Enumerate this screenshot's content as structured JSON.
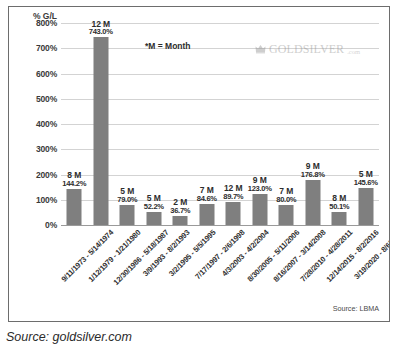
{
  "figure": {
    "source_caption": "Source: goldsilver.com",
    "inner_source": "Source: LBMA",
    "note": "*M = Month",
    "watermark": {
      "name": "GOLDSILVER",
      "suffix": ".com",
      "logo_icon": "goldsilver-crown-logo-icon"
    }
  },
  "chart_data": {
    "type": "bar",
    "title": "",
    "subtitle": "",
    "xlabel": "",
    "ylabel": "% G/L",
    "ylim": [
      0,
      800
    ],
    "ytick_labels": [
      "800%",
      "700%",
      "600%",
      "500%",
      "400%",
      "300%",
      "200%",
      "100%",
      "0%"
    ],
    "ytick_values": [
      800,
      700,
      600,
      500,
      400,
      300,
      200,
      100,
      0
    ],
    "grid": true,
    "legend": "none",
    "bar_color": "#7f7f7f",
    "annotations": [
      "*M = Month",
      "Source: LBMA"
    ],
    "categories": [
      "9/11/1973 - 5/14/1974",
      "1/12/1979 - 1/21/1980",
      "12/30/1986 - 5/18/1987",
      "3/9/1993 - 8/2/1993",
      "3/2/1995 - 5/5/1995",
      "7/17/1997 - 2/6/1998",
      "4/3/2003 - 4/2/2004",
      "8/30/2005 - 5/11/2006",
      "8/16/2007 - 3/14/2008",
      "7/28/2010 - 4/28/2011",
      "12/14/2015 - 8/2/2016",
      "3/19/2020 - 8/6/2020"
    ],
    "values": [
      144.2,
      743.0,
      79.0,
      52.2,
      36.7,
      84.6,
      89.7,
      123.0,
      80.0,
      176.8,
      50.1,
      145.6
    ],
    "value_labels": [
      "144.2%",
      "743.0%",
      "79.0%",
      "52.2%",
      "36.7%",
      "84.6%",
      "89.7%",
      "123.0%",
      "80.0%",
      "176.8%",
      "50.1%",
      "145.6%"
    ],
    "durations": [
      "8 M",
      "12 M",
      "5 M",
      "5 M",
      "2 M",
      "7 M",
      "12 M",
      "9 M",
      "7 M",
      "9 M",
      "8 M",
      "5 M"
    ]
  }
}
